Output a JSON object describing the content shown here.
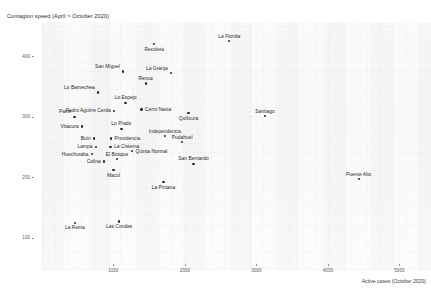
{
  "chart_data": {
    "type": "scatter",
    "title": "Contagion speed (April > October 2020)",
    "xlabel": "Active cases (October 2020)",
    "ylabel": "",
    "xlim": [
      0,
      5400
    ],
    "ylim": [
      60,
      450
    ],
    "grid": false,
    "legend": null,
    "xticks": [
      1000,
      2000,
      3000,
      4000,
      5000
    ],
    "yticks": [
      400,
      300,
      200,
      100
    ],
    "points": [
      {
        "label": "Recoleta",
        "x": 1570,
        "y": 420,
        "label_pos": "below"
      },
      {
        "label": "La Florida",
        "x": 2620,
        "y": 425,
        "label_pos": "above"
      },
      {
        "label": "San Miguel",
        "x": 1130,
        "y": 375,
        "label_pos": "above-left"
      },
      {
        "label": "La Granja",
        "x": 1800,
        "y": 372,
        "label_pos": "above-left"
      },
      {
        "label": "Renca",
        "x": 1450,
        "y": 355,
        "label_pos": "above"
      },
      {
        "label": "Lo Barnechea",
        "x": 780,
        "y": 340,
        "label_pos": "above-left"
      },
      {
        "label": "Lo Espejo",
        "x": 1170,
        "y": 323,
        "label_pos": "above"
      },
      {
        "label": "Pedro Aguirre Cerda",
        "x": 1010,
        "y": 310,
        "label_pos": "left"
      },
      {
        "label": "Cerro Navia",
        "x": 1390,
        "y": 312,
        "label_pos": "right"
      },
      {
        "label": "Paine",
        "x": 455,
        "y": 300,
        "label_pos": "above-left"
      },
      {
        "label": "Quilicura",
        "x": 2050,
        "y": 306,
        "label_pos": "below"
      },
      {
        "label": "Santiago",
        "x": 3120,
        "y": 301,
        "label_pos": "above"
      },
      {
        "label": "Vitacura",
        "x": 560,
        "y": 284,
        "label_pos": "left"
      },
      {
        "label": "Lo Prado",
        "x": 1110,
        "y": 280,
        "label_pos": "above"
      },
      {
        "label": "Buin",
        "x": 730,
        "y": 264,
        "label_pos": "left"
      },
      {
        "label": "Providencia",
        "x": 965,
        "y": 264,
        "label_pos": "right"
      },
      {
        "label": "Independencia",
        "x": 1720,
        "y": 268,
        "label_pos": "above"
      },
      {
        "label": "Lampa",
        "x": 755,
        "y": 250,
        "label_pos": "left"
      },
      {
        "label": "La Cisterna",
        "x": 960,
        "y": 250,
        "label_pos": "right"
      },
      {
        "label": "Pudahuel",
        "x": 1960,
        "y": 258,
        "label_pos": "above"
      },
      {
        "label": "Huechuraba",
        "x": 700,
        "y": 238,
        "label_pos": "left"
      },
      {
        "label": "Quinta Normal",
        "x": 1260,
        "y": 243,
        "label_pos": "right"
      },
      {
        "label": "El Bosque",
        "x": 1050,
        "y": 230,
        "label_pos": "above"
      },
      {
        "label": "Colina",
        "x": 870,
        "y": 226,
        "label_pos": "left"
      },
      {
        "label": "San Bernardo",
        "x": 2120,
        "y": 222,
        "label_pos": "above"
      },
      {
        "label": "Macul",
        "x": 1000,
        "y": 212,
        "label_pos": "below"
      },
      {
        "label": "Puente Alto",
        "x": 4430,
        "y": 197,
        "label_pos": "above"
      },
      {
        "label": "La Pintana",
        "x": 1700,
        "y": 192,
        "label_pos": "below"
      },
      {
        "label": "La Reina",
        "x": 460,
        "y": 125,
        "label_pos": "below"
      },
      {
        "label": "Las Condes",
        "x": 1080,
        "y": 127,
        "label_pos": "below"
      }
    ]
  }
}
